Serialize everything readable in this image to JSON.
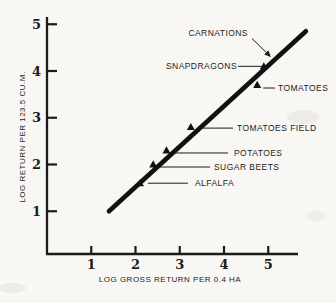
{
  "style": {
    "paper": "#f8f7f4",
    "ink": "#1b1b1b",
    "trend_line_color": "#111111",
    "marker_color": "#111111"
  },
  "chart_data": {
    "type": "scatter",
    "xlabel": "LOG GROSS RETURN PER 0.4 HA",
    "ylabel": "LOG RETURN PER 123.5 CU.M.",
    "xticks": [
      1,
      2,
      3,
      4,
      5
    ],
    "yticks": [
      1,
      2,
      3,
      4,
      5
    ],
    "xlim": [
      0,
      5.7
    ],
    "ylim": [
      0,
      5.4
    ],
    "grid": false,
    "marker": "filled-triangle",
    "points": [
      {
        "label": "ALFALFA",
        "x": 2.1,
        "y": 1.6
      },
      {
        "label": "SUGAR BEETS",
        "x": 2.4,
        "y": 2.0
      },
      {
        "label": "POTATOES",
        "x": 2.7,
        "y": 2.3
      },
      {
        "label": "TOMATOES FIELD",
        "x": 3.25,
        "y": 2.8
      },
      {
        "label": "TOMATOES",
        "x": 4.75,
        "y": 3.7
      },
      {
        "label": "SNAPDRAGONS",
        "x": 4.9,
        "y": 4.1
      },
      {
        "label": "CARNATIONS",
        "x": 5.1,
        "y": 4.25,
        "marker": "none"
      }
    ],
    "trend_line": {
      "x1": 1.4,
      "y1": 1.0,
      "x2": 5.85,
      "y2": 4.85
    },
    "legend": null
  }
}
